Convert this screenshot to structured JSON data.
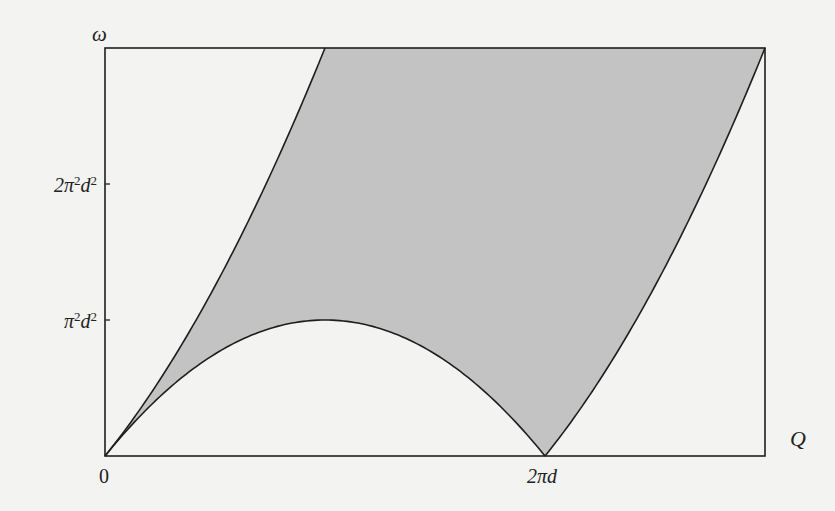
{
  "chart_data": {
    "type": "area",
    "title": "",
    "xlabel": "Q",
    "ylabel": "ω",
    "x_ticks": [
      {
        "value_in_pi_d": 0,
        "label": "0"
      },
      {
        "value_in_pi_d": 2,
        "label": "2πd"
      }
    ],
    "y_ticks": [
      {
        "value_in_pi2_d2": 1,
        "label": "π²d²"
      },
      {
        "value_in_pi2_d2": 2,
        "label": "2π²d²"
      }
    ],
    "xlim_in_pi_d": [
      0,
      3
    ],
    "ylim_in_pi2_d2": [
      0,
      3
    ],
    "grid": false,
    "legend": null,
    "units_note": "x in units of πd, y in units of π²d²",
    "boundaries": [
      {
        "name": "upper-left boundary",
        "formula": "w = 2q + q^2",
        "q_range": [
          0,
          1
        ]
      },
      {
        "name": "lower arc",
        "formula": "w = 2q - q^2",
        "q_range": [
          0,
          2
        ]
      },
      {
        "name": "right boundary",
        "formula": "w = q^2 - 2q",
        "q_range": [
          2,
          3
        ]
      }
    ],
    "shaded_region": "between upper-left boundary and lower arc / right boundary",
    "shade_color": "#c3c3c3",
    "line_color": "#1e1e1e"
  },
  "labels": {
    "y_axis": "ω",
    "x_axis": "Q",
    "tick_zero": "0",
    "tick_2pid": "2πd",
    "tick_pi2d2_base": "π",
    "tick_pi2d2_mid": "d",
    "tick_2pi2d2_base": "2π",
    "tick_2pi2d2_mid": "d",
    "sup2": "2"
  },
  "layout": {
    "origin_px": [
      105,
      456
    ],
    "px_per_unit_x": 220,
    "px_per_unit_y": 136
  }
}
